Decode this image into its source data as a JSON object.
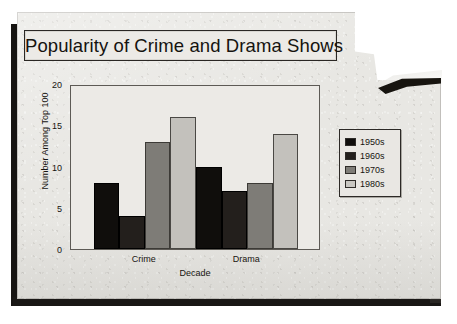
{
  "document": {
    "kind": "scanned-worksheet-page",
    "paper_color": "#e8e7e3",
    "shadow_color": "#161412"
  },
  "chart_data": {
    "type": "bar",
    "title": "Popularity of Crime and Drama Shows",
    "xlabel": "Decade",
    "ylabel": "Number Among Top 100",
    "categories": [
      "Crime",
      "Drama"
    ],
    "series": [
      {
        "name": "1950s",
        "color": "#100e0c",
        "values": [
          8,
          10
        ]
      },
      {
        "name": "1960s",
        "color": "#231f1c",
        "values": [
          4,
          7
        ]
      },
      {
        "name": "1970s",
        "color": "#7e7c77",
        "values": [
          13,
          8
        ]
      },
      {
        "name": "1980s",
        "color": "#c3c1bc",
        "values": [
          16,
          14
        ]
      }
    ],
    "ylim": [
      0,
      20
    ],
    "yticks": [
      0,
      5,
      10,
      15,
      20
    ],
    "grid": false,
    "legend_position": "right",
    "bar_gap": "none-within-group"
  }
}
